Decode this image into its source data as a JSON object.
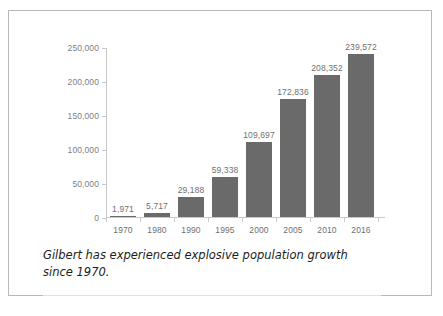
{
  "figure": {
    "caption": "Gilbert has experienced explosive population growth since 1970."
  },
  "chart_data": {
    "type": "bar",
    "title": "",
    "xlabel": "",
    "ylabel": "",
    "categories": [
      "1970",
      "1980",
      "1990",
      "1995",
      "2000",
      "2005",
      "2010",
      "2016"
    ],
    "values": [
      1971,
      5717,
      29188,
      59338,
      109697,
      172836,
      208352,
      239572
    ],
    "value_labels": [
      "1,971",
      "5,717",
      "29,188",
      "59,338",
      "109,697",
      "172,836",
      "208,352",
      "239,572"
    ],
    "ylim": [
      0,
      250000
    ],
    "ytick_values": [
      0,
      50000,
      100000,
      150000,
      200000,
      250000
    ],
    "ytick_labels": [
      "0",
      "50,000",
      "100,000",
      "150,000",
      "200,000",
      "250,000"
    ],
    "grid": false,
    "legend": null,
    "bar_color": "#6a6a6a",
    "axis_color": "#c9c9c9",
    "label_color": "#6f6f6f"
  }
}
